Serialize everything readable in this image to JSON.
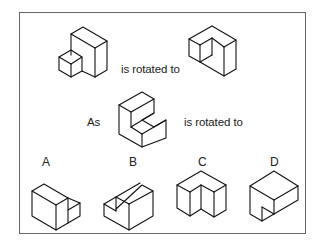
{
  "question": {
    "example_text": "is rotated to",
    "prompt_prefix": "As",
    "prompt_text": "is rotated to"
  },
  "options": [
    {
      "label": "A"
    },
    {
      "label": "B"
    },
    {
      "label": "C"
    },
    {
      "label": "D"
    }
  ],
  "colors": {
    "frame": "#666666",
    "line": "#111111",
    "background": "#ffffff"
  }
}
